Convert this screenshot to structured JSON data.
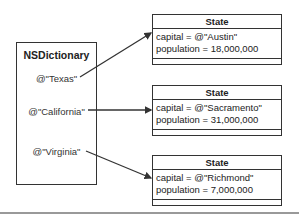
{
  "dictionary": {
    "title": "NSDictionary",
    "keys": [
      "@\"Texas\"",
      "@\"California\"",
      "@\"Virginia\""
    ]
  },
  "states": [
    {
      "header": "State",
      "capital_line": "capital =  @\"Austin\"",
      "population_line": "population = 18,000,000"
    },
    {
      "header": "State",
      "capital_line": "capital =  @\"Sacramento\"",
      "population_line": "population = 31,000,000"
    },
    {
      "header": "State",
      "capital_line": "capital =  @\"Richmond\"",
      "population_line": "population = 7,000,000"
    }
  ],
  "colors": {
    "line": "#333333",
    "separator": "#999999"
  }
}
